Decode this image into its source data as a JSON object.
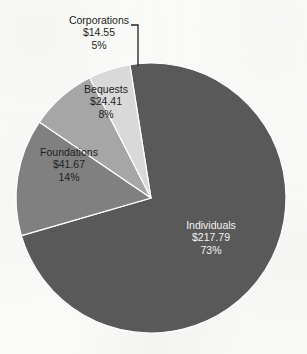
{
  "chart_data": {
    "type": "pie",
    "title": "",
    "subtitle": "",
    "xlabel": "",
    "ylabel": "",
    "legend_position": "none",
    "grid": false,
    "value_prefix": "$",
    "categories": [
      "Individuals",
      "Foundations",
      "Bequests",
      "Corporations"
    ],
    "values": [
      217.79,
      41.67,
      24.41,
      14.55
    ],
    "percents": [
      73,
      14,
      8,
      5
    ],
    "slice_colors": [
      "#595959",
      "#808080",
      "#a6a6a6",
      "#d9d9d9"
    ],
    "slices": [
      {
        "label": "Individuals",
        "value_text": "$217.79",
        "percent_text": "73%",
        "value": 217.79,
        "percent": 73,
        "color": "#595959",
        "label_placement": "inside"
      },
      {
        "label": "Foundations",
        "value_text": "$41.67",
        "percent_text": "14%",
        "value": 41.67,
        "percent": 14,
        "color": "#808080",
        "label_placement": "inside"
      },
      {
        "label": "Bequests",
        "value_text": "$24.41",
        "percent_text": "8%",
        "value": 24.41,
        "percent": 8,
        "color": "#a6a6a6",
        "label_placement": "inside"
      },
      {
        "label": "Corporations",
        "value_text": "$14.55",
        "percent_text": "5%",
        "value": 14.55,
        "percent": 5,
        "color": "#d9d9d9",
        "label_placement": "outside-leader"
      }
    ]
  },
  "labels": {
    "individuals": {
      "name": "Individuals",
      "value": "$217.79",
      "percent": "73%"
    },
    "foundations": {
      "name": "Foundations",
      "value": "$41.67",
      "percent": "14%"
    },
    "bequests": {
      "name": "Bequests",
      "value": "$24.41",
      "percent": "8%"
    },
    "corporations": {
      "name": "Corporations",
      "value": "$14.55",
      "percent": "5%"
    }
  },
  "colors": {
    "background": "#fcfcfb",
    "text": "#231f20",
    "text_on_dark": "#f2f2f2",
    "slice_individuals": "#595959",
    "slice_foundations": "#808080",
    "slice_bequests": "#a6a6a6",
    "slice_corporations": "#d9d9d9",
    "slice_border": "#ffffff",
    "leader_line": "#231f20"
  }
}
